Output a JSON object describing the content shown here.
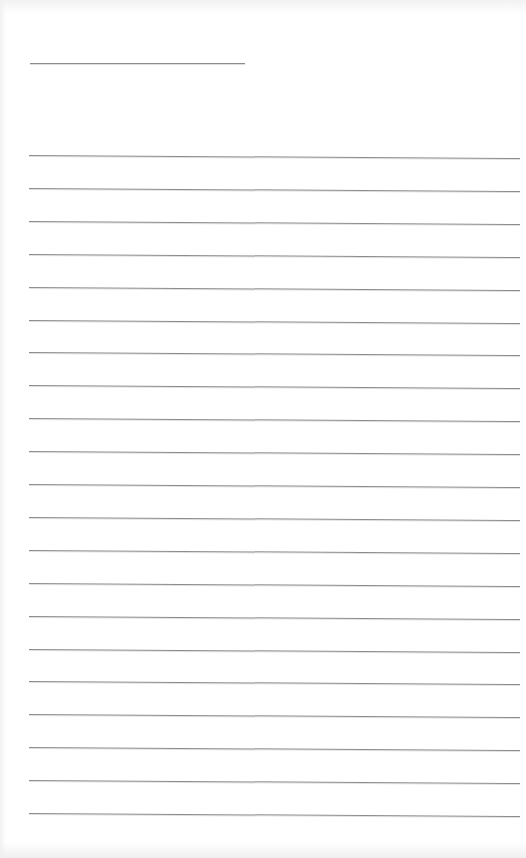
{
  "page": {
    "type": "lined-paper",
    "background": "#ffffff",
    "line_color": "#8c8c8c"
  },
  "title_line": {
    "x": 30,
    "y": 63,
    "width": 215
  },
  "rules": {
    "x": 29,
    "width": 491,
    "start_y": 155,
    "spacing": 32.9,
    "count": 21,
    "slope_deg": 0.35
  }
}
